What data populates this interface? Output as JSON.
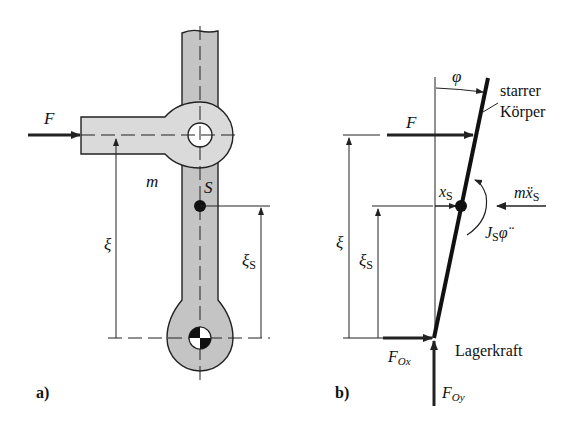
{
  "figure_a": {
    "panel_label": "a)",
    "force_label": "F",
    "mass_label": "m",
    "center_of_mass_label": "S",
    "dim_xi_label": "ξ",
    "dim_xi_s_label": "ξ",
    "dim_xi_s_sub": "S",
    "colors": {
      "body_fill": "#c9c9c9",
      "arm_fill": "#dcdcdc",
      "outline": "#222222"
    }
  },
  "figure_b": {
    "panel_label": "b)",
    "angle_label": "φ",
    "body_label_line1": "starrer",
    "body_label_line2": "Körper",
    "force_label": "F",
    "xs_label": "x",
    "xs_sub": "S",
    "inertia_force_label": "mẍ",
    "inertia_force_sub": "S",
    "inertia_moment_label": "J",
    "inertia_moment_sub": "S",
    "inertia_moment_sym": "φ̈",
    "dim_xi_label": "ξ",
    "dim_xi_s_label": "ξ",
    "dim_xi_s_sub": "S",
    "bearing_fx_label": "F",
    "bearing_fx_sub": "Ox",
    "bearing_fy_label": "F",
    "bearing_fy_sub": "Oy",
    "bearing_label": "Lagerkraft"
  }
}
